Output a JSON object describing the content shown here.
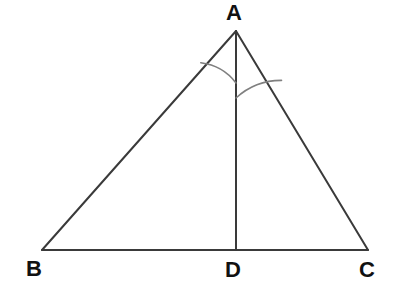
{
  "figure": {
    "kind": "geometry-diagram",
    "shape": "triangle-with-cevian",
    "background_color": "#ffffff",
    "line_color": "#3a3a3a",
    "arc_color": "#808080",
    "label_color": "#111111",
    "stroke_width": 2,
    "arc_stroke_width": 1.6,
    "width": 397,
    "height": 303
  },
  "labels": {
    "apex": "A",
    "bottom_left": "B",
    "bottom_middle": "D",
    "bottom_right": "C"
  },
  "points": {
    "A": {
      "x": 236,
      "y": 31
    },
    "B": {
      "x": 42,
      "y": 250
    },
    "C": {
      "x": 368,
      "y": 250
    },
    "D": {
      "x": 236,
      "y": 250
    }
  },
  "segments": [
    {
      "name": "AB",
      "from": "A",
      "to": "B"
    },
    {
      "name": "AC",
      "from": "A",
      "to": "C"
    },
    {
      "name": "BC",
      "from": "B",
      "to": "C"
    },
    {
      "name": "AD",
      "from": "A",
      "to": "D"
    }
  ],
  "angle_arcs": [
    {
      "name": "angle-BAD",
      "vertex": "A",
      "between": [
        "AB",
        "AD"
      ],
      "radius": 52,
      "path": "M 200.8 62.8 A 52 52 0 0 1 236 83"
    },
    {
      "name": "angle-DAC",
      "vertex": "A",
      "between": [
        "AD",
        "AC"
      ],
      "radius": 67,
      "path": "M 236 98 A 67 67 0 0 1 281.5 80.4"
    }
  ]
}
